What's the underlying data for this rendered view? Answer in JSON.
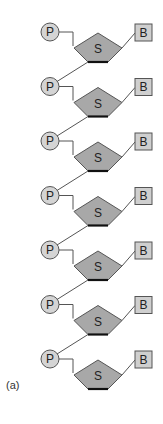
{
  "figure": {
    "panel_label": "(a)",
    "unit_count": 7,
    "labels": {
      "phosphate": "P",
      "sugar": "S",
      "base": "B"
    },
    "colors": {
      "phosphate_fill": "#d4d4d4",
      "sugar_fill": "#a8a8a8",
      "base_fill": "#cfcfcf",
      "stroke": "#555555",
      "sugar_bottom_edge": "#111111",
      "background": "#ffffff"
    },
    "units": [
      {
        "phosphate": "P",
        "sugar": "S",
        "base": "B"
      },
      {
        "phosphate": "P",
        "sugar": "S",
        "base": "B"
      },
      {
        "phosphate": "P",
        "sugar": "S",
        "base": "B"
      },
      {
        "phosphate": "P",
        "sugar": "S",
        "base": "B"
      },
      {
        "phosphate": "P",
        "sugar": "S",
        "base": "B"
      },
      {
        "phosphate": "P",
        "sugar": "S",
        "base": "B"
      },
      {
        "phosphate": "P",
        "sugar": "S",
        "base": "B"
      }
    ]
  }
}
